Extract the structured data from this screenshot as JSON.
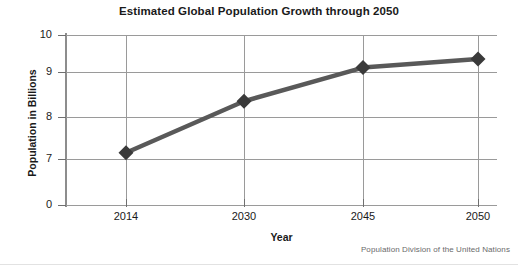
{
  "chart_data": {
    "type": "line",
    "title": "Estimated Global Population Growth through 2050",
    "xlabel": "Year",
    "ylabel": "Population in Billions",
    "categories": [
      "2014",
      "2030",
      "2045",
      "2050"
    ],
    "values": [
      7.15,
      8.35,
      9.12,
      9.35
    ],
    "series": [
      {
        "name": "Estimated global population",
        "values": [
          7.15,
          8.35,
          9.12,
          9.35
        ],
        "marker": "diamond",
        "color": "#595959"
      }
    ],
    "ytick_labels": [
      "10",
      "9",
      "8",
      "7",
      "0"
    ],
    "ytick_values": [
      10,
      9,
      8,
      7,
      0
    ],
    "xtick_labels": [
      "2014",
      "2030",
      "2045",
      "2050"
    ],
    "ylim": [
      0,
      10
    ],
    "axis_note": "y-axis scale is broken between 7 and 0",
    "grid": "both",
    "legend": "none",
    "source": "Population Division of the United Nations"
  },
  "figure": {
    "title": "Estimated Global Population Growth through 2050",
    "ylabel": "Population in Billions",
    "xlabel": "Year",
    "source": "Population Division of the United Nations"
  }
}
